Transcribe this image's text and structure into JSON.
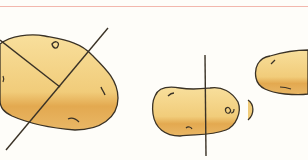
{
  "illustration": {
    "subject": "potatoes with cutting lines",
    "colors": {
      "rule": "#f2b7ad",
      "potato_light": "#f6d68c",
      "potato_shade": "#e3a950",
      "outline": "#3a3226",
      "background": "#fefdf9"
    },
    "potatoes": [
      {
        "name": "large potato",
        "cuts": "two crossing diagonal lines"
      },
      {
        "name": "small potato",
        "cuts": "one vertical line"
      },
      {
        "name": "partial potato",
        "cuts": "none"
      }
    ]
  }
}
